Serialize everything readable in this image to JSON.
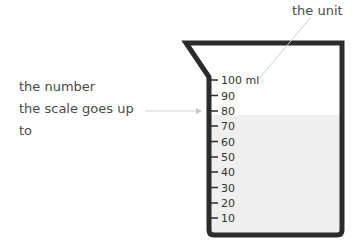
{
  "annotations": {
    "unit_label": "the unit",
    "number_label_lines": [
      "the number",
      "the scale goes up",
      "to"
    ]
  },
  "beaker": {
    "unit": "ml",
    "max_value": 100,
    "fill_level": 78,
    "scale": [
      {
        "value": 100,
        "label": "100 ml"
      },
      {
        "value": 90,
        "label": "90"
      },
      {
        "value": 80,
        "label": "80"
      },
      {
        "value": 70,
        "label": "70"
      },
      {
        "value": 60,
        "label": "60"
      },
      {
        "value": 50,
        "label": "50"
      },
      {
        "value": 40,
        "label": "40"
      },
      {
        "value": 30,
        "label": "30"
      },
      {
        "value": 20,
        "label": "20"
      },
      {
        "value": 10,
        "label": "10"
      }
    ]
  },
  "colors": {
    "outline": "#2b2b2b",
    "liquid": "#efefef",
    "leader": "#cfcfcf",
    "text": "#4a4a4a"
  }
}
